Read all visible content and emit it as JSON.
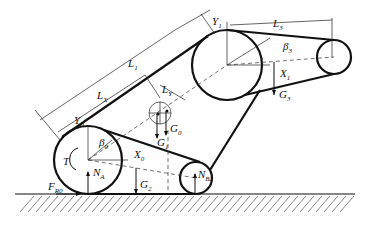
{
  "diagram": {
    "labels": {
      "L1": {
        "main": "L",
        "sub": "1"
      },
      "LX": {
        "main": "L",
        "sub": "X"
      },
      "LY": {
        "main": "L",
        "sub": "Y"
      },
      "L3": {
        "main": "L",
        "sub": "3"
      },
      "Y1": {
        "main": "Y",
        "sub": "1"
      },
      "X1": {
        "main": "X",
        "sub": "1"
      },
      "beta3": {
        "main": "β",
        "sub": "3"
      },
      "G3": {
        "main": "G",
        "sub": "3"
      },
      "Y0": {
        "main": "Y",
        "sub": "0"
      },
      "X0": {
        "main": "X",
        "sub": "0"
      },
      "beta0": {
        "main": "β",
        "sub": "0"
      },
      "T": {
        "main": "T",
        "sub": ""
      },
      "NA": {
        "main": "N",
        "sub": "A"
      },
      "FR0": {
        "main": "F",
        "sub": "R0"
      },
      "G0": {
        "main": "G",
        "sub": "0"
      },
      "G1": {
        "main": "G",
        "sub": "1"
      },
      "G2": {
        "main": "G",
        "sub": "2"
      },
      "NB": {
        "main": "N",
        "sub": "B2"
      }
    },
    "colors": {
      "line": "#111111",
      "background": "#ffffff"
    }
  }
}
